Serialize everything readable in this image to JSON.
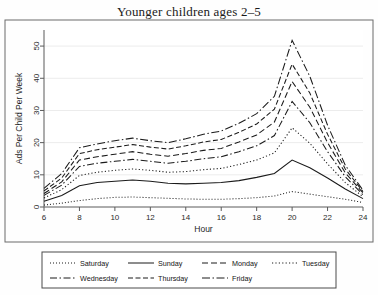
{
  "chart_data": {
    "type": "line",
    "title": "Younger children ages 2–5",
    "xlabel": "Hour",
    "ylabel": "Ads Per Child Per Week",
    "xlim": [
      6,
      24
    ],
    "ylim": [
      0,
      55
    ],
    "xticks": [
      6,
      8,
      10,
      12,
      14,
      16,
      18,
      20,
      22,
      24
    ],
    "yticks": [
      0,
      10,
      20,
      30,
      40,
      50
    ],
    "grid": "horizontal",
    "legend_position": "bottom",
    "x": [
      6,
      7,
      8,
      9,
      10,
      11,
      12,
      13,
      14,
      15,
      16,
      17,
      18,
      19,
      20,
      21,
      22,
      23,
      24
    ],
    "series": [
      {
        "name": "Saturday",
        "dash": "1,2",
        "values": [
          0.6,
          1.2,
          2.0,
          2.6,
          3.0,
          3.1,
          2.9,
          2.7,
          2.5,
          2.4,
          2.4,
          2.6,
          2.9,
          3.4,
          4.8,
          4.0,
          3.2,
          2.4,
          1.4
        ]
      },
      {
        "name": "Sunday",
        "dash": "none",
        "values": [
          1.8,
          3.6,
          6.6,
          7.6,
          8.0,
          8.4,
          8.0,
          7.4,
          7.2,
          7.4,
          7.6,
          8.2,
          9.2,
          10.4,
          14.6,
          12.2,
          9.0,
          5.6,
          2.6
        ]
      },
      {
        "name": "Monday",
        "dash": "6,3",
        "values": [
          4.2,
          7.8,
          14.6,
          15.6,
          16.4,
          17.2,
          16.4,
          15.8,
          16.6,
          17.6,
          18.2,
          20.2,
          22.4,
          26.4,
          39.0,
          31.0,
          20.0,
          10.6,
          4.4
        ]
      },
      {
        "name": "Tuesday",
        "dash": "1.2,2.2",
        "values": [
          2.8,
          5.4,
          9.8,
          10.8,
          11.4,
          11.8,
          11.4,
          10.8,
          11.0,
          11.6,
          12.0,
          13.2,
          14.6,
          16.8,
          24.6,
          19.8,
          13.4,
          7.6,
          3.2
        ]
      },
      {
        "name": "Wednesday",
        "dash": "7,2.5,1.5,2.5",
        "values": [
          3.6,
          6.8,
          12.6,
          13.6,
          14.2,
          14.8,
          14.2,
          13.6,
          14.2,
          15.0,
          15.6,
          17.2,
          19.0,
          22.2,
          32.8,
          26.2,
          17.2,
          9.4,
          3.8
        ]
      },
      {
        "name": "Thursday",
        "dash": "5,2.5",
        "values": [
          5.0,
          9.0,
          16.6,
          17.8,
          18.6,
          19.4,
          18.6,
          18.0,
          19.0,
          20.2,
          21.0,
          23.2,
          25.8,
          30.4,
          44.4,
          35.4,
          22.6,
          11.8,
          4.8
        ]
      },
      {
        "name": "Friday",
        "dash": "8,2.5,1.5,2.5",
        "values": [
          5.8,
          10.4,
          18.4,
          19.6,
          20.6,
          21.4,
          20.6,
          20.0,
          21.2,
          22.6,
          23.6,
          26.0,
          29.0,
          34.4,
          51.8,
          40.6,
          25.4,
          13.0,
          5.2
        ]
      }
    ]
  }
}
